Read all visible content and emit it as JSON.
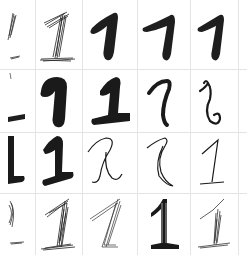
{
  "digit_label": "1",
  "grid": {
    "rows": 4,
    "columns": 5,
    "line_color": "#e4e4e4",
    "background": "#ffffff"
  },
  "col_edges": [
    0,
    35,
    82,
    137,
    190,
    238,
    247
  ],
  "row_edges": [
    0,
    69,
    132,
    193,
    255
  ],
  "cells": [
    {
      "row": 0,
      "col": 0,
      "style": "sketchy-partial"
    },
    {
      "row": 0,
      "col": 1,
      "style": "sketchy-hatched"
    },
    {
      "row": 0,
      "col": 2,
      "style": "bold-marker"
    },
    {
      "row": 0,
      "col": 3,
      "style": "bold-marker"
    },
    {
      "row": 0,
      "col": 4,
      "style": "bold-marker"
    },
    {
      "row": 1,
      "col": 0,
      "style": "bold-partial"
    },
    {
      "row": 1,
      "col": 1,
      "style": "bold-marker"
    },
    {
      "row": 1,
      "col": 2,
      "style": "bold-marker-base"
    },
    {
      "row": 1,
      "col": 3,
      "style": "medium-pen"
    },
    {
      "row": 1,
      "col": 4,
      "style": "curly-pen"
    },
    {
      "row": 2,
      "col": 0,
      "style": "bold-partial"
    },
    {
      "row": 2,
      "col": 1,
      "style": "bold-marker-base"
    },
    {
      "row": 2,
      "col": 2,
      "style": "thin-cursive"
    },
    {
      "row": 2,
      "col": 3,
      "style": "thin-outline"
    },
    {
      "row": 2,
      "col": 4,
      "style": "thin-serif"
    },
    {
      "row": 3,
      "col": 0,
      "style": "sketchy-partial"
    },
    {
      "row": 3,
      "col": 1,
      "style": "sketchy-hatched"
    },
    {
      "row": 3,
      "col": 2,
      "style": "thin-hatched"
    },
    {
      "row": 3,
      "col": 3,
      "style": "outline-base"
    },
    {
      "row": 3,
      "col": 4,
      "style": "sketchy-hatched"
    }
  ]
}
